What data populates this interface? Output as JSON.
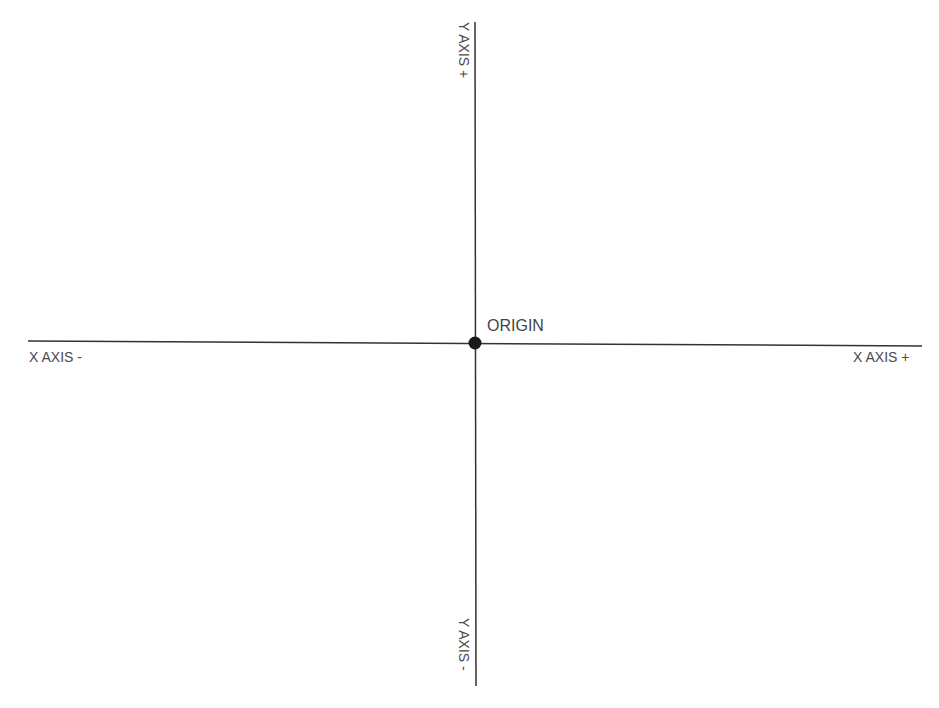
{
  "diagram": {
    "colors": {
      "axis_line": "#333333",
      "label": "#4a4a4a",
      "origin_point": "#1a1a1a"
    },
    "labels": {
      "origin": "ORIGIN",
      "x_positive": "X AXIS +",
      "x_negative": "X AXIS -",
      "y_positive": "Y AXIS +",
      "y_negative": "Y AXIS -"
    }
  }
}
